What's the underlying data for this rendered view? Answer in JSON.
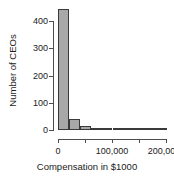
{
  "chart_data": {
    "type": "bar",
    "title": "",
    "xlabel": "Compensation in $1000",
    "ylabel": "Number of CEOs",
    "xlim": [
      0,
      250000
    ],
    "ylim": [
      0,
      440
    ],
    "grid": false,
    "legend": "none",
    "bin_width": 25000,
    "categories": [
      "0-25,000",
      "25,000-50,000",
      "50,000-75,000",
      "75,000-100,000",
      "100,000-125,000",
      "125,000-150,000",
      "150,000-175,000",
      "175,000-200,000",
      "200,000-225,000",
      "225,000-250,000"
    ],
    "bin_starts": [
      0,
      25000,
      50000,
      75000,
      100000,
      125000,
      150000,
      175000,
      200000,
      225000
    ],
    "values": [
      435,
      40,
      13,
      4,
      1,
      1,
      0,
      0,
      0,
      1
    ],
    "x_ticks": [
      0,
      50000,
      100000,
      150000,
      200000
    ],
    "x_tick_labels": [
      "0",
      "",
      "100,000",
      "",
      "200,000"
    ],
    "y_ticks": [
      0,
      100,
      200,
      300,
      400
    ],
    "y_tick_labels": [
      "0",
      "100",
      "200",
      "300",
      "400"
    ],
    "bar_fill_color": "#a8a8a8",
    "bar_border_color": "#3a3a3a",
    "axis_color": "#4d4d4d"
  }
}
